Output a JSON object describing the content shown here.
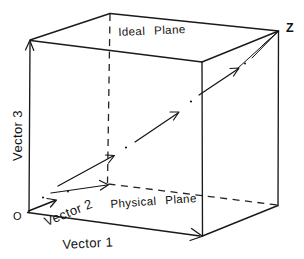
{
  "figure": {
    "type": "technical-line-diagram",
    "background_color": "#ffffff",
    "ink_color": "#141414",
    "width": 304,
    "height": 259
  },
  "labels": {
    "ideal_plane": "Ideal",
    "ideal_plane_2": "Plane",
    "physical_plane": "Physical",
    "physical_plane_2": "Plane",
    "vector_3": "Vector 3",
    "vector_1": "Vector 1",
    "vector_2": "Vector 2",
    "origin": "O",
    "z_point": "Z"
  },
  "geometry": {
    "projection": "oblique cavalier",
    "front_face": {
      "top_left": [
        30,
        40
      ],
      "top_right": [
        202,
        62
      ],
      "bottom_right": [
        202,
        236
      ],
      "bottom_left": [
        27,
        212
      ]
    },
    "back_face": {
      "top_left": [
        110,
        13
      ],
      "top_right": [
        278,
        31
      ],
      "bottom_right": [
        278,
        205
      ],
      "bottom_left": [
        107,
        184
      ]
    },
    "hidden_edges": [
      "back-left vertical",
      "back-left-bottom to back-right-bottom",
      "front-bottom-left to back-bottom-left"
    ],
    "axes": [
      {
        "name": "Vector 1",
        "from": [
          27,
          212
        ],
        "to": [
          202,
          236
        ],
        "arrow": true
      },
      {
        "name": "Vector 3",
        "from": [
          27,
          212
        ],
        "to": [
          30,
          40
        ],
        "arrow": true
      },
      {
        "name": "Vector 2",
        "from": [
          27,
          212
        ],
        "to": [
          107,
          184
        ],
        "arrow": true
      }
    ],
    "main_diagonal": {
      "name": "resultant vector O to Z",
      "from": [
        27,
        212
      ],
      "to": [
        278,
        31
      ],
      "style": "dash-dot chain of arrow segments with interposed dots",
      "segment_count": 3,
      "dot_count": 3
    }
  }
}
